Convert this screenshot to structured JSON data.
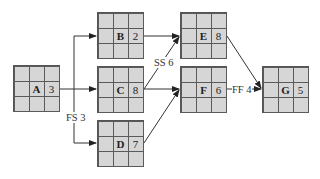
{
  "diagram": {
    "type": "precedence-network",
    "colors": {
      "node_fill": "#d6d6d6",
      "node_border": "#555555",
      "line": "#333333",
      "background": "#ffffff"
    },
    "nodes": [
      {
        "id": "A",
        "label": "A",
        "duration": "3",
        "x": 13,
        "y": 65
      },
      {
        "id": "B",
        "label": "B",
        "duration": "2",
        "x": 97,
        "y": 12
      },
      {
        "id": "C",
        "label": "C",
        "duration": "8",
        "x": 97,
        "y": 66
      },
      {
        "id": "D",
        "label": "D",
        "duration": "7",
        "x": 97,
        "y": 120
      },
      {
        "id": "E",
        "label": "E",
        "duration": "8",
        "x": 180,
        "y": 12
      },
      {
        "id": "F",
        "label": "F",
        "duration": "6",
        "x": 180,
        "y": 66
      },
      {
        "id": "G",
        "label": "G",
        "duration": "5",
        "x": 262,
        "y": 66
      }
    ],
    "edges": [
      {
        "from": "A",
        "to": "B",
        "label": ""
      },
      {
        "from": "A",
        "to": "C",
        "label": ""
      },
      {
        "from": "A",
        "to": "D",
        "label": "FS 3"
      },
      {
        "from": "B",
        "to": "E",
        "label": ""
      },
      {
        "from": "C",
        "to": "E",
        "label": "SS 6"
      },
      {
        "from": "C",
        "to": "F",
        "label": ""
      },
      {
        "from": "D",
        "to": "F",
        "label": ""
      },
      {
        "from": "E",
        "to": "G",
        "label": ""
      },
      {
        "from": "F",
        "to": "G",
        "label": "FF 4"
      }
    ],
    "edge_labels": {
      "fs3": "FS 3",
      "ss6": "SS 6",
      "ff4": "FF 4"
    }
  }
}
